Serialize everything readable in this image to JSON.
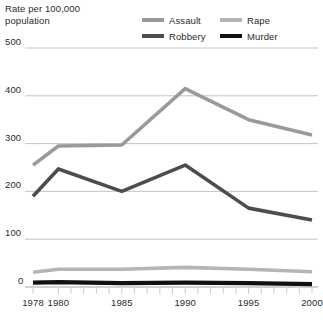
{
  "axis_title": "Rate per 100,000\npopulation",
  "legend": {
    "items": [
      {
        "label": "Assault",
        "color": "#9a9a9a",
        "swatch_name": "legend-swatch-assault"
      },
      {
        "label": "Rape",
        "color": "#b5b5b5",
        "swatch_name": "legend-swatch-rape"
      },
      {
        "label": "Robbery",
        "color": "#4d4d4d",
        "swatch_name": "legend-swatch-robbery"
      },
      {
        "label": "Murder",
        "color": "#111111",
        "swatch_name": "legend-swatch-murder"
      }
    ]
  },
  "chart_data": {
    "type": "line",
    "title": "",
    "xlabel": "",
    "ylabel": "Rate per 100,000 population",
    "x": [
      1978,
      1980,
      1985,
      1990,
      1995,
      2000
    ],
    "xtick_labels": [
      "1978",
      "1980",
      "1985",
      "1990",
      "1995",
      "2000"
    ],
    "xlim": [
      1978,
      2000
    ],
    "ylim": [
      0,
      500
    ],
    "ytick_labels": [
      "0",
      "100",
      "200",
      "300",
      "400",
      "500"
    ],
    "yticks": [
      0,
      100,
      200,
      300,
      400,
      500
    ],
    "grid": true,
    "legend_position": "top-right",
    "series": [
      {
        "name": "Assault",
        "color": "#9a9a9a",
        "values": [
          255,
          295,
          297,
          415,
          350,
          318
        ]
      },
      {
        "name": "Robbery",
        "color": "#4d4d4d",
        "values": [
          190,
          247,
          200,
          255,
          165,
          140
        ]
      },
      {
        "name": "Rape",
        "color": "#b5b5b5",
        "values": [
          31,
          37,
          37,
          41,
          37,
          32
        ]
      },
      {
        "name": "Murder",
        "color": "#111111",
        "values": [
          9,
          10,
          8,
          9,
          8,
          6
        ]
      }
    ]
  },
  "geometry": {
    "plot_left": 33,
    "plot_right": 312,
    "y_zero": 287,
    "y_top": 48,
    "y_value_top": 500
  }
}
